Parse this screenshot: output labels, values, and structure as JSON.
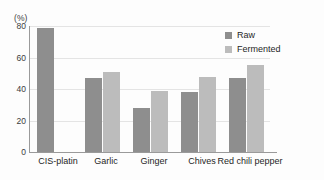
{
  "title_remnant": "",
  "legend": {
    "position": "top-right",
    "entries": [
      {
        "label": "Raw",
        "color": "#8e8e8e"
      },
      {
        "label": "Fermented",
        "color": "#bcbcbc"
      }
    ]
  },
  "axis": {
    "y_unit_label": "(%)",
    "y_ticks": [
      "0",
      "20",
      "40",
      "60",
      "80"
    ]
  },
  "chart_data": {
    "type": "bar",
    "title": "",
    "subtitle": "",
    "xlabel": "",
    "ylabel": "(%)",
    "ylim": [
      0,
      80
    ],
    "ytick_values": [
      0,
      20,
      40,
      60,
      80
    ],
    "grid": true,
    "legend_position": "top-right",
    "categories": [
      "CIS-platin",
      "Garlic",
      "Ginger",
      "Chives",
      "Red chili pepper"
    ],
    "series": [
      {
        "name": "Raw",
        "color": "#8e8e8e",
        "values": [
          79,
          47,
          28,
          38,
          47
        ]
      },
      {
        "name": "Fermented",
        "color": "#bcbcbc",
        "values": [
          null,
          51,
          38.5,
          47.5,
          55
        ]
      }
    ]
  }
}
